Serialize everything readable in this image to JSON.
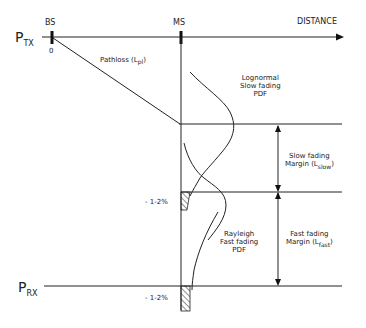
{
  "diagram": {
    "axis": {
      "label": "DISTANCE",
      "origin_label": "0"
    },
    "nodes": {
      "bs": "BS",
      "ms": "MS"
    },
    "levels": {
      "ptx": {
        "main": "P",
        "sub": "TX"
      },
      "prx": {
        "main": "P",
        "sub": "RX"
      }
    },
    "pathloss": {
      "text": "Pathloss (L",
      "sub": "pl",
      "close": ")"
    },
    "lognormal_pdf": {
      "line1": "Lognormal",
      "line2": "Slow fading",
      "line3": "PDF"
    },
    "rayleigh_pdf": {
      "line1": "Rayleigh",
      "line2": "Fast fading",
      "line3": "PDF"
    },
    "slow_margin": {
      "line1": "Slow fading",
      "line2": "Margin (L",
      "sub": "slow",
      "close": ")"
    },
    "fast_margin": {
      "line1": "Fast fading",
      "line2": "Margin (L",
      "sub": "fast",
      "close": ")"
    },
    "outage_labels": [
      "- 1-2%",
      "- 1-2%"
    ],
    "colors": {
      "ink": "#1a1a1a",
      "background": "#ffffff"
    }
  }
}
